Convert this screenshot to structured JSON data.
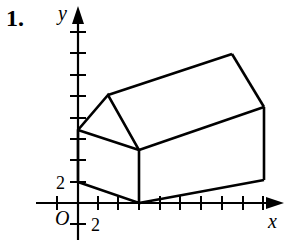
{
  "problem_number": "1.",
  "axes": {
    "x_label": "x",
    "y_label": "y",
    "origin_label": "O",
    "x_tick_label": "2",
    "y_tick_label": "2"
  },
  "figure": {
    "stroke_color": "#000000"
  }
}
